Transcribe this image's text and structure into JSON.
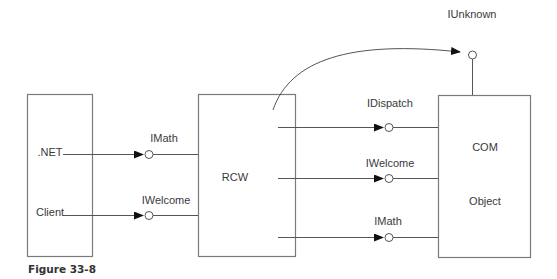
{
  "diagram": {
    "nodes": {
      "client": {
        "lines": [
          ".NET",
          "Client"
        ]
      },
      "rcw": {
        "label": "RCW"
      },
      "com": {
        "lines": [
          "COM",
          "Object"
        ]
      }
    },
    "interfaces": {
      "client_to_rcw": [
        "IMath",
        "IWelcome"
      ],
      "rcw_to_com": [
        "IDispatch",
        "IWelcome",
        "IMath"
      ],
      "com_top": "IUnknown"
    },
    "edges": [
      {
        "from": "client",
        "to": "rcw",
        "interface": "IMath"
      },
      {
        "from": "client",
        "to": "rcw",
        "interface": "IWelcome"
      },
      {
        "from": "rcw",
        "to": "com",
        "interface": "IDispatch"
      },
      {
        "from": "rcw",
        "to": "com",
        "interface": "IWelcome"
      },
      {
        "from": "rcw",
        "to": "com",
        "interface": "IMath"
      },
      {
        "from": "rcw",
        "to": "com",
        "interface": "IUnknown",
        "style": "curved"
      }
    ]
  },
  "caption": "Figure 33-8"
}
